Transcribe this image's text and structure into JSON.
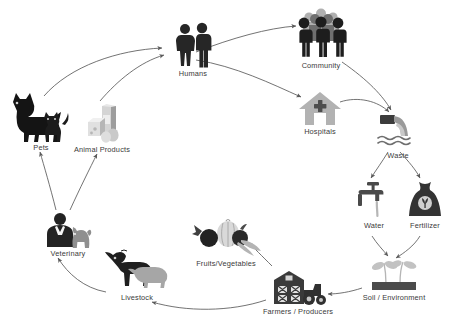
{
  "diagram": {
    "layout": "circular",
    "colors": {
      "dark": "#262626",
      "mid": "#6b6b6b",
      "light": "#b9b9b9",
      "pale": "#d8d8d8",
      "arrow": "#5a5a5a",
      "label": "#3a3a3a",
      "background": "#ffffff"
    },
    "nodes": [
      {
        "id": "humans",
        "label": "Humans",
        "icon": "two-people-icon",
        "x": 168,
        "y": 22,
        "w": 50,
        "h": 58
      },
      {
        "id": "community",
        "label": "Community",
        "icon": "crowd-group-icon",
        "x": 290,
        "y": 8,
        "w": 62,
        "h": 62
      },
      {
        "id": "hospitals",
        "label": "Hospitals",
        "icon": "hospital-house-icon",
        "x": 296,
        "y": 90,
        "w": 48,
        "h": 48
      },
      {
        "id": "waste",
        "label": "Waste",
        "icon": "waste-pipe-water-icon",
        "x": 375,
        "y": 112,
        "w": 46,
        "h": 48
      },
      {
        "id": "water",
        "label": "Water",
        "icon": "faucet-tap-icon",
        "x": 355,
        "y": 180,
        "w": 38,
        "h": 46
      },
      {
        "id": "fertilizer",
        "label": "Fertilizer",
        "icon": "fertilizer-sack-icon",
        "x": 406,
        "y": 180,
        "w": 38,
        "h": 46
      },
      {
        "id": "soil",
        "label": "Soil / Environment",
        "icon": "seedling-soil-icon",
        "x": 366,
        "y": 254,
        "w": 56,
        "h": 48
      },
      {
        "id": "farmers",
        "label": "Farmers / Producers",
        "icon": "barn-tractor-icon",
        "x": 268,
        "y": 268,
        "w": 60,
        "h": 46
      },
      {
        "id": "fruitsvegetables",
        "label": "Fruits/Vegetables",
        "icon": "vegetables-icon",
        "x": 190,
        "y": 218,
        "w": 72,
        "h": 48
      },
      {
        "id": "livestock",
        "label": "Livestock",
        "icon": "cow-pig-icon",
        "x": 104,
        "y": 248,
        "w": 66,
        "h": 52
      },
      {
        "id": "veterinary",
        "label": "Veterinary",
        "icon": "vet-with-pet-icon",
        "x": 44,
        "y": 212,
        "w": 48,
        "h": 46
      },
      {
        "id": "animalproducts",
        "label": "Animal Products",
        "icon": "dairy-eggs-icon",
        "x": 80,
        "y": 104,
        "w": 44,
        "h": 50
      },
      {
        "id": "pets",
        "label": "Pets",
        "icon": "dog-cat-icon",
        "x": 8,
        "y": 92,
        "w": 66,
        "h": 60
      }
    ],
    "edges": [
      {
        "from": "pets",
        "to": "humans",
        "label": ""
      },
      {
        "from": "animalproducts",
        "to": "humans",
        "label": ""
      },
      {
        "from": "humans",
        "to": "community",
        "label": ""
      },
      {
        "from": "humans",
        "to": "hospitals",
        "label": ""
      },
      {
        "from": "community",
        "to": "waste",
        "label": ""
      },
      {
        "from": "hospitals",
        "to": "waste",
        "label": ""
      },
      {
        "from": "waste",
        "to": "water",
        "label": ""
      },
      {
        "from": "waste",
        "to": "fertilizer",
        "label": ""
      },
      {
        "from": "water",
        "to": "soil",
        "label": ""
      },
      {
        "from": "fertilizer",
        "to": "soil",
        "label": ""
      },
      {
        "from": "soil",
        "to": "farmers",
        "label": ""
      },
      {
        "from": "farmers",
        "to": "fruitsvegetables",
        "label": ""
      },
      {
        "from": "farmers",
        "to": "livestock",
        "label": ""
      },
      {
        "from": "livestock",
        "to": "veterinary",
        "label": ""
      },
      {
        "from": "veterinary",
        "to": "pets",
        "label": ""
      },
      {
        "from": "veterinary",
        "to": "animalproducts",
        "label": ""
      }
    ]
  }
}
